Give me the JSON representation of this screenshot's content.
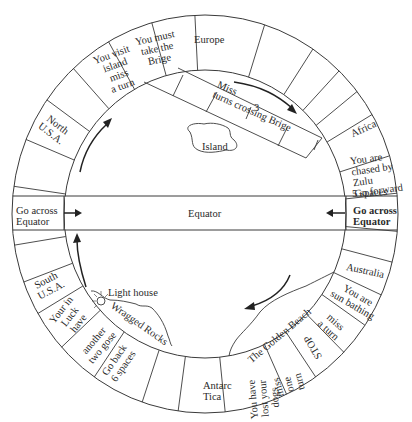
{
  "board": {
    "title": "Equator",
    "center": [
      205,
      214
    ],
    "outer_radius": [
      193,
      199
    ],
    "inner_radius": [
      141,
      144
    ],
    "line_color": "#3a3a3a",
    "equator_band": {
      "top": 196,
      "bottom": 230,
      "label": "Equator"
    }
  },
  "squares": [
    {
      "id": "go-across-equator-left",
      "text": "Go across\nEquator",
      "x": 16,
      "y": 205,
      "rot": 0,
      "cls": "left"
    },
    {
      "id": "north-usa",
      "text": "North\nU.S.A.",
      "x": 40,
      "y": 118,
      "rot": 38
    },
    {
      "id": "you-visit-island",
      "text": "You visit\nisland\nmiss\na turn",
      "x": 98,
      "y": 48,
      "rot": -20
    },
    {
      "id": "you-must-take-brige",
      "text": "You must\ntake the\nBrige",
      "x": 137,
      "y": 32,
      "rot": -12
    },
    {
      "id": "europe",
      "text": "Europe",
      "x": 194,
      "y": 34,
      "rot": 0
    },
    {
      "id": "africa",
      "text": "Africa",
      "x": 350,
      "y": 123,
      "rot": -25
    },
    {
      "id": "chased-by-zulu",
      "text": "You are\nchased by\nZulu\nGo forward",
      "x": 352,
      "y": 152,
      "rot": -8,
      "cls": "left"
    },
    {
      "id": "five-spaces",
      "text": "5 spaces",
      "x": 352,
      "y": 187,
      "rot": -3
    },
    {
      "id": "go-across-equator-right",
      "text": "Go across\nEquator",
      "x": 353,
      "y": 205,
      "rot": 0,
      "cls": "left bold"
    },
    {
      "id": "australia",
      "text": "Australia",
      "x": 346,
      "y": 265,
      "rot": 12
    },
    {
      "id": "sun-bathing",
      "text": "You are\nsun bathing",
      "x": 331,
      "y": 289,
      "rot": 30
    },
    {
      "id": "miss-a-turn",
      "text": "miss\na turn",
      "x": 320,
      "y": 315,
      "rot": 42
    },
    {
      "id": "stop",
      "text": "STOP",
      "x": 300,
      "y": 342,
      "rot": 240
    },
    {
      "id": "miss-one-turn",
      "text": "miss\none\nturn",
      "x": 279,
      "y": 368,
      "rot": 255
    },
    {
      "id": "lost-dogs",
      "text": "You have\nlost your\ndogs",
      "x": 244,
      "y": 382,
      "rot": 265
    },
    {
      "id": "antarctica",
      "text": "Antarc\nTica",
      "x": 203,
      "y": 380,
      "rot": 0,
      "cls": "left"
    },
    {
      "id": "go-back-six",
      "text": "Go back\n6 spaces",
      "x": 101,
      "y": 352,
      "rot": -55
    },
    {
      "id": "two-gose",
      "text": "another\ntwo gose",
      "x": 79,
      "y": 333,
      "rot": -50
    },
    {
      "id": "your-in-luck",
      "text": "Your in\nLuck\nhave",
      "x": 54,
      "y": 300,
      "rot": -52
    },
    {
      "id": "south-usa",
      "text": "South\nU.S.A.",
      "x": 34,
      "y": 274,
      "rot": -28
    }
  ],
  "inner_labels": [
    {
      "id": "equator-center",
      "text": "Equator",
      "x": 188,
      "y": 208,
      "rot": 0
    },
    {
      "id": "island",
      "text": "Island",
      "x": 202,
      "y": 141,
      "rot": 0
    },
    {
      "id": "miss-turns-crossing",
      "text": "Miss\nturns crossing Brige",
      "x": 212,
      "y": 95,
      "rot": 24,
      "cls": "left"
    },
    {
      "id": "bridge-three",
      "text": "3",
      "x": 254,
      "y": 102,
      "rot": 0
    },
    {
      "id": "light-house",
      "text": "Light house",
      "x": 108,
      "y": 287,
      "rot": 0
    },
    {
      "id": "wragged-rocks",
      "text": "Wragged Rocks",
      "x": 106,
      "y": 318,
      "rot": 35
    },
    {
      "id": "golden-beach",
      "text": "The Golden Beach",
      "x": 240,
      "y": 330,
      "rot": -40
    }
  ],
  "radial_lines_deg": [
    172,
    158,
    145,
    133,
    120,
    106,
    93,
    72,
    56,
    46,
    38,
    30,
    17,
    6,
    -5,
    -14,
    -24,
    -34,
    -44,
    -55,
    -65,
    -84,
    -98,
    -109,
    -125,
    -138,
    -150,
    -160,
    -171
  ],
  "arrows": [
    {
      "id": "arrow-upper-left",
      "direction": "clockwise"
    },
    {
      "id": "arrow-upper-right",
      "direction": "clockwise"
    },
    {
      "id": "arrow-lower-right",
      "direction": "clockwise"
    },
    {
      "id": "arrow-lower-left",
      "direction": "clockwise"
    },
    {
      "id": "arrow-equator-left",
      "direction": "right"
    },
    {
      "id": "arrow-equator-right",
      "direction": "left"
    }
  ]
}
